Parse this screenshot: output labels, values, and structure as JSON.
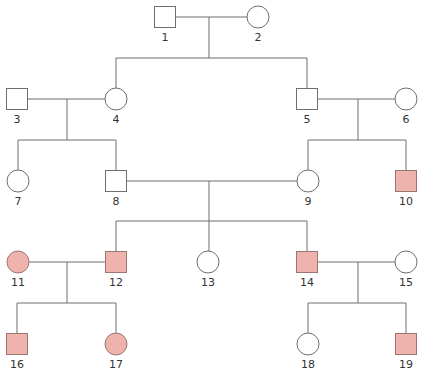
{
  "diagram": {
    "type": "pedigree",
    "colors": {
      "line": "#6f6f6f",
      "unaffected_fill": "#ffffff",
      "unaffected_stroke": "#6f6f6f",
      "affected_fill": "#efb3ae",
      "affected_stroke": "#9a7673"
    },
    "individuals": [
      {
        "id": "1",
        "label": "1",
        "sex": "male",
        "affected": false,
        "x": 165,
        "y": 17
      },
      {
        "id": "2",
        "label": "2",
        "sex": "female",
        "affected": false,
        "x": 258,
        "y": 17
      },
      {
        "id": "3",
        "label": "3",
        "sex": "male",
        "affected": false,
        "x": 17,
        "y": 99
      },
      {
        "id": "4",
        "label": "4",
        "sex": "female",
        "affected": false,
        "x": 116,
        "y": 99
      },
      {
        "id": "5",
        "label": "5",
        "sex": "male",
        "affected": false,
        "x": 307,
        "y": 99
      },
      {
        "id": "6",
        "label": "6",
        "sex": "female",
        "affected": false,
        "x": 406,
        "y": 99
      },
      {
        "id": "7",
        "label": "7",
        "sex": "female",
        "affected": false,
        "x": 18,
        "y": 181
      },
      {
        "id": "8",
        "label": "8",
        "sex": "male",
        "affected": false,
        "x": 116,
        "y": 181
      },
      {
        "id": "9",
        "label": "9",
        "sex": "female",
        "affected": false,
        "x": 308,
        "y": 181
      },
      {
        "id": "10",
        "label": "10",
        "sex": "male",
        "affected": true,
        "x": 406,
        "y": 181
      },
      {
        "id": "11",
        "label": "11",
        "sex": "female",
        "affected": true,
        "x": 18,
        "y": 262
      },
      {
        "id": "12",
        "label": "12",
        "sex": "male",
        "affected": true,
        "x": 116,
        "y": 262
      },
      {
        "id": "13",
        "label": "13",
        "sex": "female",
        "affected": false,
        "x": 208,
        "y": 262
      },
      {
        "id": "14",
        "label": "14",
        "sex": "male",
        "affected": true,
        "x": 307,
        "y": 262
      },
      {
        "id": "15",
        "label": "15",
        "sex": "female",
        "affected": false,
        "x": 406,
        "y": 262
      },
      {
        "id": "16",
        "label": "16",
        "sex": "male",
        "affected": true,
        "x": 17,
        "y": 344
      },
      {
        "id": "17",
        "label": "17",
        "sex": "female",
        "affected": true,
        "x": 116,
        "y": 344
      },
      {
        "id": "18",
        "label": "18",
        "sex": "female",
        "affected": false,
        "x": 308,
        "y": 344
      },
      {
        "id": "19",
        "label": "19",
        "sex": "male",
        "affected": true,
        "x": 406,
        "y": 344
      }
    ],
    "lines": [
      {
        "x1": 176,
        "y1": 17,
        "x2": 247,
        "y2": 17
      },
      {
        "x1": 209,
        "y1": 17,
        "x2": 209,
        "y2": 58
      },
      {
        "x1": 116,
        "y1": 58,
        "x2": 307,
        "y2": 58
      },
      {
        "x1": 116,
        "y1": 58,
        "x2": 116,
        "y2": 88
      },
      {
        "x1": 307,
        "y1": 58,
        "x2": 307,
        "y2": 88
      },
      {
        "x1": 28,
        "y1": 99,
        "x2": 105,
        "y2": 99
      },
      {
        "x1": 67,
        "y1": 99,
        "x2": 67,
        "y2": 140
      },
      {
        "x1": 18,
        "y1": 140,
        "x2": 116,
        "y2": 140
      },
      {
        "x1": 18,
        "y1": 140,
        "x2": 18,
        "y2": 170
      },
      {
        "x1": 116,
        "y1": 140,
        "x2": 116,
        "y2": 170
      },
      {
        "x1": 318,
        "y1": 99,
        "x2": 395,
        "y2": 99
      },
      {
        "x1": 358,
        "y1": 99,
        "x2": 358,
        "y2": 140
      },
      {
        "x1": 308,
        "y1": 140,
        "x2": 406,
        "y2": 140
      },
      {
        "x1": 308,
        "y1": 140,
        "x2": 308,
        "y2": 170
      },
      {
        "x1": 406,
        "y1": 140,
        "x2": 406,
        "y2": 170
      },
      {
        "x1": 127,
        "y1": 181,
        "x2": 297,
        "y2": 181
      },
      {
        "x1": 209,
        "y1": 181,
        "x2": 209,
        "y2": 251
      },
      {
        "x1": 116,
        "y1": 221,
        "x2": 307,
        "y2": 221
      },
      {
        "x1": 116,
        "y1": 221,
        "x2": 116,
        "y2": 251
      },
      {
        "x1": 307,
        "y1": 221,
        "x2": 307,
        "y2": 251
      },
      {
        "x1": 29,
        "y1": 262,
        "x2": 105,
        "y2": 262
      },
      {
        "x1": 67,
        "y1": 262,
        "x2": 67,
        "y2": 303
      },
      {
        "x1": 17,
        "y1": 303,
        "x2": 116,
        "y2": 303
      },
      {
        "x1": 17,
        "y1": 303,
        "x2": 17,
        "y2": 333
      },
      {
        "x1": 116,
        "y1": 303,
        "x2": 116,
        "y2": 333
      },
      {
        "x1": 318,
        "y1": 262,
        "x2": 395,
        "y2": 262
      },
      {
        "x1": 358,
        "y1": 262,
        "x2": 358,
        "y2": 303
      },
      {
        "x1": 308,
        "y1": 303,
        "x2": 406,
        "y2": 303
      },
      {
        "x1": 308,
        "y1": 303,
        "x2": 308,
        "y2": 333
      },
      {
        "x1": 406,
        "y1": 303,
        "x2": 406,
        "y2": 333
      }
    ]
  }
}
